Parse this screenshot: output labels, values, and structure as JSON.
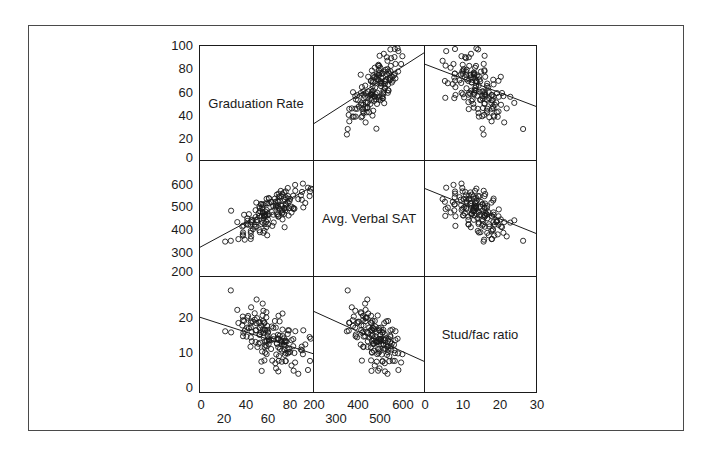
{
  "chart_data": {
    "type": "scatter",
    "subtype": "scatterplot-matrix",
    "title": "",
    "variables": [
      "Graduation Rate",
      "Avg. Verbal SAT",
      "Stud/fac ratio"
    ],
    "diagonal_labels": [
      "Graduation Rate",
      "Avg. Verbal SAT",
      "Stud/fac ratio"
    ],
    "axes": {
      "Graduation Rate": {
        "range": [
          0,
          100
        ],
        "y_ticks": [
          "0",
          "20",
          "40",
          "60",
          "80",
          "100"
        ],
        "x_ticks_top_row": [
          "0",
          "40",
          "80"
        ],
        "x_ticks_bottom_row": [
          "20",
          "60"
        ]
      },
      "Avg. Verbal SAT": {
        "range": [
          200,
          700
        ],
        "y_ticks": [
          "200",
          "300",
          "400",
          "500",
          "600"
        ],
        "x_ticks_top_row": [
          "200",
          "400",
          "600"
        ],
        "x_ticks_bottom_row": [
          "300",
          "500"
        ]
      },
      "Stud/fac ratio": {
        "range": [
          0,
          30
        ],
        "y_ticks": [
          "0",
          "10",
          "20"
        ],
        "x_ticks_top_row": [
          "0",
          "10",
          "20",
          "30"
        ],
        "x_ticks_bottom_row": []
      }
    },
    "panels": [
      {
        "row": 0,
        "col": 1,
        "x": "Avg. Verbal SAT",
        "y": "Graduation Rate",
        "trend": "positive",
        "fit_line": [
          [
            200,
            32
          ],
          [
            700,
            94
          ]
        ]
      },
      {
        "row": 0,
        "col": 2,
        "x": "Stud/fac ratio",
        "y": "Graduation Rate",
        "trend": "negative",
        "fit_line": [
          [
            0,
            84
          ],
          [
            30,
            47
          ]
        ]
      },
      {
        "row": 1,
        "col": 0,
        "x": "Graduation Rate",
        "y": "Avg. Verbal SAT",
        "trend": "positive",
        "fit_line": [
          [
            0,
            325
          ],
          [
            100,
            590
          ]
        ]
      },
      {
        "row": 1,
        "col": 2,
        "x": "Stud/fac ratio",
        "y": "Avg. Verbal SAT",
        "trend": "negative",
        "fit_line": [
          [
            0,
            580
          ],
          [
            30,
            385
          ]
        ]
      },
      {
        "row": 2,
        "col": 0,
        "x": "Graduation Rate",
        "y": "Stud/fac ratio",
        "trend": "negative",
        "fit_line": [
          [
            0,
            19.5
          ],
          [
            100,
            10
          ]
        ]
      },
      {
        "row": 2,
        "col": 1,
        "x": "Avg. Verbal SAT",
        "y": "Stud/fac ratio",
        "trend": "negative",
        "fit_line": [
          [
            200,
            21
          ],
          [
            700,
            8
          ]
        ]
      }
    ],
    "grid": false,
    "legend": null
  },
  "labels": {
    "diag_0": "Graduation Rate",
    "diag_1": "Avg. Verbal SAT",
    "diag_2": "Stud/fac ratio"
  },
  "ticks": {
    "row0_y": [
      "100",
      "80",
      "60",
      "40",
      "20",
      "0"
    ],
    "row1_y": [
      "600",
      "500",
      "400",
      "300",
      "200"
    ],
    "row2_y": [
      "20",
      "10",
      "0"
    ],
    "col0_x_top": [
      "0",
      "40",
      "80"
    ],
    "col0_x_bottom": [
      "20",
      "60"
    ],
    "col1_x_top": [
      "200",
      "400",
      "600"
    ],
    "col1_x_bottom": [
      "300",
      "500"
    ],
    "col2_x_top": [
      "0",
      "10",
      "20",
      "30"
    ]
  },
  "colors": {
    "ink": "#1a1a1a",
    "frame": "#4a4a4a",
    "background": "#ffffff"
  }
}
